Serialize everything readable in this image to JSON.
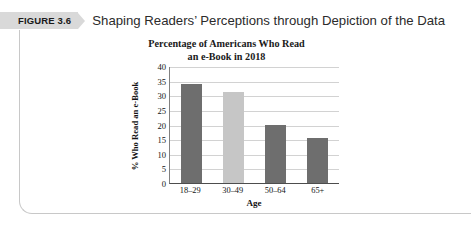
{
  "figure": {
    "badge_label": "FIGURE 3.6",
    "caption": "Shaping Readers’ Perceptions through Depiction of the Data"
  },
  "chart_data": {
    "type": "bar",
    "title": "Percentage of Americans Who Read\nan e-Book in 2018",
    "title_line1": "Percentage of Americans Who Read",
    "title_line2": "an e-Book in 2018",
    "xlabel": "Age",
    "ylabel": "% Who Read an e-Book",
    "categories": [
      "18–29",
      "30–49",
      "50–64",
      "65+"
    ],
    "values": [
      34,
      31,
      20,
      15.5
    ],
    "bar_colors": [
      "#6e6e6e",
      "#c6c6c6",
      "#6e6e6e",
      "#6e6e6e"
    ],
    "ylim": [
      0,
      40
    ],
    "yticks": [
      0,
      5,
      10,
      15,
      20,
      25,
      30,
      35,
      40
    ],
    "ytick_labels": [
      "0",
      "5",
      "10",
      "15",
      "20",
      "25",
      "30",
      "35",
      "40"
    ],
    "grid": true,
    "legend": false,
    "gridline_color": "#d2d2d2",
    "axis_color": "#4d4d4d"
  },
  "theme": {
    "badge_background": "#d9d9d9",
    "frame_border": "#c8c8c8",
    "text_color": "#141414",
    "caption_color": "#2b2b2b",
    "page_background": "#ffffff"
  }
}
